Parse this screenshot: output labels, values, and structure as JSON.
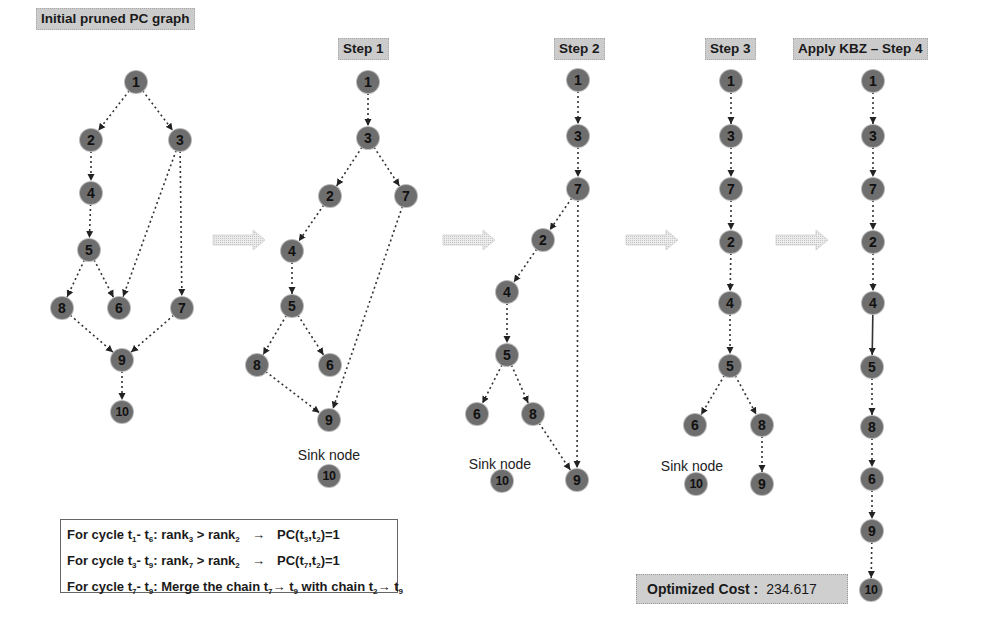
{
  "panels": [
    {
      "id": "initial",
      "title": "Initial pruned PC graph",
      "title_pos": [
        36,
        8
      ],
      "nodes": [
        {
          "id": "1",
          "x": 136,
          "y": 82
        },
        {
          "id": "2",
          "x": 91,
          "y": 140
        },
        {
          "id": "3",
          "x": 180,
          "y": 140
        },
        {
          "id": "4",
          "x": 91,
          "y": 193
        },
        {
          "id": "5",
          "x": 89,
          "y": 250
        },
        {
          "id": "8",
          "x": 62,
          "y": 308
        },
        {
          "id": "6",
          "x": 119,
          "y": 308
        },
        {
          "id": "7",
          "x": 182,
          "y": 308
        },
        {
          "id": "9",
          "x": 122,
          "y": 360
        },
        {
          "id": "10",
          "x": 122,
          "y": 412
        }
      ],
      "edges": [
        [
          "1",
          "2"
        ],
        [
          "1",
          "3"
        ],
        [
          "2",
          "4"
        ],
        [
          "4",
          "5"
        ],
        [
          "5",
          "8"
        ],
        [
          "5",
          "6"
        ],
        [
          "3",
          "6"
        ],
        [
          "3",
          "7"
        ],
        [
          "8",
          "9"
        ],
        [
          "7",
          "9"
        ],
        [
          "9",
          "10"
        ]
      ]
    },
    {
      "id": "step1",
      "title": "Step 1",
      "title_pos": [
        338,
        38
      ],
      "nodes": [
        {
          "id": "1",
          "x": 368,
          "y": 82
        },
        {
          "id": "3",
          "x": 368,
          "y": 138
        },
        {
          "id": "2",
          "x": 330,
          "y": 196
        },
        {
          "id": "7",
          "x": 406,
          "y": 196
        },
        {
          "id": "4",
          "x": 292,
          "y": 251
        },
        {
          "id": "5",
          "x": 292,
          "y": 306
        },
        {
          "id": "8",
          "x": 257,
          "y": 365
        },
        {
          "id": "6",
          "x": 330,
          "y": 365
        },
        {
          "id": "9",
          "x": 329,
          "y": 420
        }
      ],
      "edges": [
        [
          "1",
          "3"
        ],
        [
          "3",
          "2"
        ],
        [
          "3",
          "7"
        ],
        [
          "2",
          "4"
        ],
        [
          "4",
          "5"
        ],
        [
          "5",
          "8"
        ],
        [
          "5",
          "6"
        ],
        [
          "8",
          "9"
        ],
        [
          "7",
          "9"
        ]
      ],
      "sink": {
        "label": "Sink node",
        "node": "10",
        "label_pos": [
          329,
          447
        ],
        "node_pos": [
          329,
          476
        ]
      }
    },
    {
      "id": "step2",
      "title": "Step 2",
      "title_pos": [
        554,
        38
      ],
      "nodes": [
        {
          "id": "1",
          "x": 578,
          "y": 80
        },
        {
          "id": "3",
          "x": 578,
          "y": 136
        },
        {
          "id": "7",
          "x": 578,
          "y": 189
        },
        {
          "id": "2",
          "x": 543,
          "y": 240
        },
        {
          "id": "4",
          "x": 507,
          "y": 292
        },
        {
          "id": "5",
          "x": 507,
          "y": 355
        },
        {
          "id": "6",
          "x": 477,
          "y": 414
        },
        {
          "id": "8",
          "x": 533,
          "y": 414
        },
        {
          "id": "9",
          "x": 577,
          "y": 480
        }
      ],
      "edges": [
        [
          "1",
          "3"
        ],
        [
          "3",
          "7"
        ],
        [
          "7",
          "2"
        ],
        [
          "2",
          "4"
        ],
        [
          "4",
          "5"
        ],
        [
          "5",
          "6"
        ],
        [
          "5",
          "8"
        ],
        [
          "8",
          "9"
        ],
        [
          "7",
          "9"
        ]
      ],
      "sink": {
        "label": "Sink node",
        "node": "10",
        "label_pos": [
          500,
          456
        ],
        "node_pos": [
          502,
          481
        ]
      }
    },
    {
      "id": "step3",
      "title": "Step 3",
      "title_pos": [
        705,
        38
      ],
      "nodes": [
        {
          "id": "1",
          "x": 731,
          "y": 81
        },
        {
          "id": "3",
          "x": 731,
          "y": 136
        },
        {
          "id": "7",
          "x": 731,
          "y": 189
        },
        {
          "id": "2",
          "x": 731,
          "y": 242
        },
        {
          "id": "4",
          "x": 730,
          "y": 303
        },
        {
          "id": "5",
          "x": 730,
          "y": 366
        },
        {
          "id": "6",
          "x": 695,
          "y": 425
        },
        {
          "id": "8",
          "x": 762,
          "y": 425
        },
        {
          "id": "9",
          "x": 762,
          "y": 484
        }
      ],
      "edges": [
        [
          "1",
          "3"
        ],
        [
          "3",
          "7"
        ],
        [
          "7",
          "2"
        ],
        [
          "2",
          "4"
        ],
        [
          "4",
          "5"
        ],
        [
          "5",
          "6"
        ],
        [
          "5",
          "8"
        ],
        [
          "8",
          "9"
        ]
      ],
      "sink": {
        "label": "Sink node",
        "node": "10",
        "label_pos": [
          692,
          458
        ],
        "node_pos": [
          696,
          484
        ]
      }
    },
    {
      "id": "step4",
      "title": "Apply KBZ – Step 4",
      "title_pos": [
        793,
        38
      ],
      "nodes": [
        {
          "id": "1",
          "x": 873,
          "y": 81
        },
        {
          "id": "3",
          "x": 873,
          "y": 136
        },
        {
          "id": "7",
          "x": 873,
          "y": 189
        },
        {
          "id": "2",
          "x": 873,
          "y": 242
        },
        {
          "id": "4",
          "x": 873,
          "y": 303
        },
        {
          "id": "5",
          "x": 872,
          "y": 367
        },
        {
          "id": "8",
          "x": 872,
          "y": 427
        },
        {
          "id": "6",
          "x": 872,
          "y": 479
        },
        {
          "id": "9",
          "x": 872,
          "y": 531
        },
        {
          "id": "10",
          "x": 871,
          "y": 590
        }
      ],
      "edges": [
        [
          "1",
          "3"
        ],
        [
          "3",
          "7"
        ],
        [
          "7",
          "2"
        ],
        [
          "2",
          "4"
        ],
        [
          "4",
          "5",
          "solid"
        ],
        [
          "5",
          "8"
        ],
        [
          "8",
          "6"
        ],
        [
          "6",
          "9"
        ],
        [
          "9",
          "10"
        ]
      ]
    }
  ],
  "step_arrows": [
    {
      "x": 213,
      "y": 230
    },
    {
      "x": 443,
      "y": 230
    },
    {
      "x": 626,
      "y": 230
    },
    {
      "x": 776,
      "y": 230
    }
  ],
  "legend": {
    "lines": [
      {
        "prefix": "For cycle t",
        "a": "1",
        "mid": "- t",
        "b": "6",
        "body": ":  rank",
        "c": "3",
        "rel": " > rank",
        "d": "2",
        "arrow": "→",
        "result": "PC(t",
        "r1": "3",
        "rsep": ",t",
        "r2": "2",
        "rend": ")=1"
      },
      {
        "prefix": "For cycle t",
        "a": "3",
        "mid": "- t",
        "b": "9",
        "body": ":  rank",
        "c": "7",
        "rel": " > rank",
        "d": "2",
        "arrow": "→",
        "result": "PC(t",
        "r1": "7",
        "rsep": ",t",
        "r2": "2",
        "rend": ")=1"
      },
      {
        "prefix": "For cycle t",
        "a": "7",
        "mid": "- t",
        "b": "9",
        "text": ":  Merge the chain t",
        "c": "7",
        "arrow": "→",
        "t2": " t",
        "d": "9",
        "with": " with chain t",
        "e": "2",
        "arrow2": "→",
        "t3": " t",
        "f": "9"
      }
    ]
  },
  "cost": {
    "label": "Optimized Cost :",
    "value": "234.617"
  },
  "colors": {
    "node_fill": "#a9a9a9",
    "edge": "#333333",
    "title_bg": "#dcdcdc",
    "arrow_fill": "#e2e2e2"
  }
}
